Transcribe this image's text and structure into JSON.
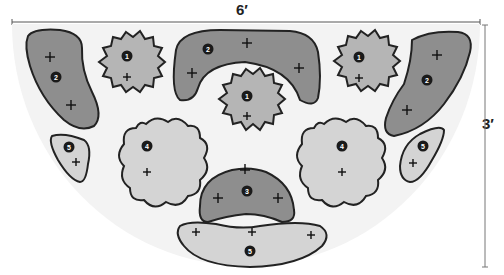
{
  "diagram": {
    "type": "garden-bed-planting-plan",
    "width_label": "6′",
    "height_label": "3′",
    "bed_shape": "semicircle",
    "colors": {
      "background": "#ffffff",
      "bed": "#f3f3f3",
      "group_2_3": "#8e8e8e",
      "group_1": "#b5b5b5",
      "group_4_5": "#d4d4d4",
      "outline": "#222222",
      "badge": "#1a1a1a"
    },
    "plant_groups": [
      {
        "id": "left-kidney",
        "label": "2",
        "plants": 2,
        "shade": "dark"
      },
      {
        "id": "left-star",
        "label": "1",
        "plants": 1,
        "shade": "mid"
      },
      {
        "id": "top-arch",
        "label": "2",
        "plants": 3,
        "shade": "dark"
      },
      {
        "id": "center-star",
        "label": "1",
        "plants": 1,
        "shade": "mid"
      },
      {
        "id": "right-star",
        "label": "1",
        "plants": 1,
        "shade": "mid"
      },
      {
        "id": "right-kidney",
        "label": "2",
        "plants": 2,
        "shade": "dark"
      },
      {
        "id": "left-small",
        "label": "5",
        "plants": 1,
        "shade": "light"
      },
      {
        "id": "left-flower",
        "label": "4",
        "plants": 1,
        "shade": "light"
      },
      {
        "id": "center-dome",
        "label": "3",
        "plants": 3,
        "shade": "dark"
      },
      {
        "id": "right-flower",
        "label": "4",
        "plants": 1,
        "shade": "light"
      },
      {
        "id": "right-small",
        "label": "5",
        "plants": 1,
        "shade": "light"
      },
      {
        "id": "bottom-crescent",
        "label": "5",
        "plants": 3,
        "shade": "light"
      }
    ]
  }
}
